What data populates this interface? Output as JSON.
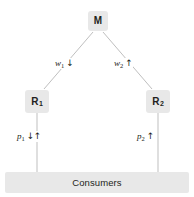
{
  "diagram": {
    "type": "supply-chain-flow-diagram",
    "nodes": [
      {
        "id": "m",
        "label": "M",
        "base": "M",
        "sub": ""
      },
      {
        "id": "r1",
        "label": "R1",
        "base": "R",
        "sub": "1"
      },
      {
        "id": "r2",
        "label": "R2",
        "base": "R",
        "sub": "2"
      }
    ],
    "consumers": {
      "label": "Consumers"
    },
    "edge_labels": [
      {
        "id": "w1",
        "base": "w",
        "sub": "1",
        "arrows": "↓",
        "arrow_names": [
          "down-arrow"
        ]
      },
      {
        "id": "w2",
        "base": "w",
        "sub": "2",
        "arrows": "↑",
        "arrow_names": [
          "up-arrow"
        ]
      },
      {
        "id": "p1",
        "base": "p",
        "sub": "1",
        "arrows": "↓↑",
        "arrow_names": [
          "down-arrow",
          "up-arrow"
        ]
      },
      {
        "id": "p2",
        "base": "p",
        "sub": "2",
        "arrows": "↑",
        "arrow_names": [
          "up-arrow"
        ]
      }
    ],
    "colors": {
      "node_fill": "#e8e8e8",
      "bar_fill": "#e8e8e8",
      "text": "#231f20",
      "edge_line": "#bfbfbf",
      "background": "#ffffff"
    }
  }
}
